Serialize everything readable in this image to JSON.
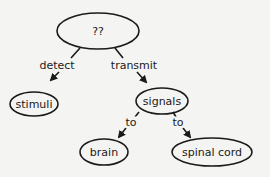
{
  "diagram": {
    "type": "concept-map",
    "colors": {
      "stroke": "#1a1a1a",
      "background": "#f4f4f2"
    },
    "nodes": [
      {
        "id": "root",
        "label": "??",
        "cx": 98,
        "cy": 31,
        "rx": 41,
        "ry": 18
      },
      {
        "id": "stimuli",
        "label": "stimuli",
        "cx": 34,
        "cy": 104,
        "rx": 24,
        "ry": 12
      },
      {
        "id": "signals",
        "label": "signals",
        "cx": 162,
        "cy": 101,
        "rx": 26,
        "ry": 13
      },
      {
        "id": "brain",
        "label": "brain",
        "cx": 104,
        "cy": 152,
        "rx": 24,
        "ry": 13
      },
      {
        "id": "spinal_cord",
        "label": "spinal cord",
        "cx": 212,
        "cy": 152,
        "rx": 40,
        "ry": 14
      }
    ],
    "edges": [
      {
        "from": "root",
        "to": "stimuli",
        "label": "detect",
        "lx": 57,
        "ly": 65
      },
      {
        "from": "root",
        "to": "signals",
        "label": "transmit",
        "lx": 134,
        "ly": 65
      },
      {
        "from": "signals",
        "to": "brain",
        "label": "to",
        "lx": 131,
        "ly": 122
      },
      {
        "from": "signals",
        "to": "spinal_cord",
        "label": "to",
        "lx": 178,
        "ly": 122
      }
    ]
  }
}
